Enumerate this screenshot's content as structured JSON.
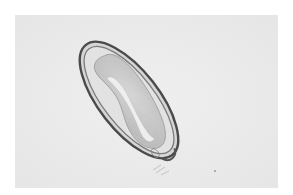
{
  "image": {
    "description": "Grayscale brightfield micrograph of an elongated oval parasite egg with a thick double-contoured shell, granular embryo inside, and a small operculum-like knob at the lower-right end",
    "colors": {
      "page_background": "#ffffff",
      "field_background": "#ececec",
      "shell_outer": "#4a4a4a",
      "shell_inner": "#8a8a8a",
      "egg_interior": "#dadada",
      "embryo": "#c8c8c8",
      "embryo_highlight": "#f2f2f2"
    }
  }
}
